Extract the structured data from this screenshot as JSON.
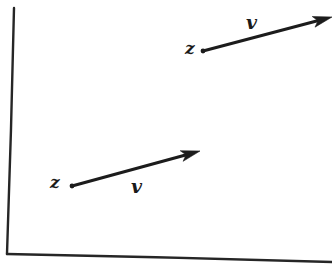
{
  "figure": {
    "background_color": "#ffffff",
    "ink_color": "#1c1c1c",
    "axis_color": "#262626",
    "width": 332,
    "height": 269
  },
  "axes": {
    "y_axis": {
      "name": "vertical-axis",
      "from": [
        14,
        8
      ],
      "to": [
        7,
        254
      ],
      "stroke_width": 2.4
    },
    "x_axis": {
      "name": "horizontal-axis",
      "from": [
        7,
        254
      ],
      "to": [
        332,
        262
      ],
      "stroke_width": 2.4
    }
  },
  "vectors": [
    {
      "id": "upper-vector",
      "point_label": "z",
      "vector_label": "v",
      "tail": [
        203,
        51
      ],
      "tip": [
        332,
        17
      ],
      "stroke_width": 3.0,
      "head_length": 19,
      "head_width": 11,
      "point_label_pos": [
        185,
        40
      ],
      "vector_label_pos": [
        246,
        13
      ]
    },
    {
      "id": "lower-vector",
      "point_label": "z",
      "vector_label": "v",
      "tail": [
        72,
        186
      ],
      "tip": [
        200,
        151
      ],
      "stroke_width": 3.0,
      "head_length": 19,
      "head_width": 11,
      "point_label_pos": [
        50,
        174
      ],
      "vector_label_pos": [
        131,
        177
      ]
    }
  ]
}
